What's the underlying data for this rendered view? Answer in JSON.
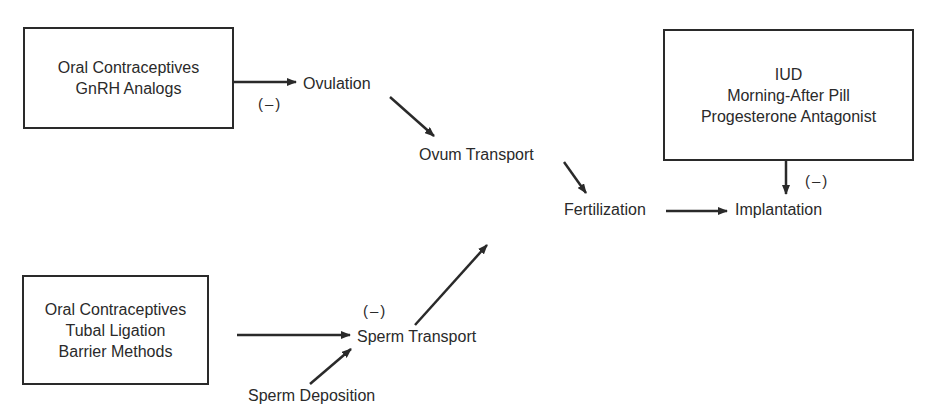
{
  "diagram": {
    "boxes": {
      "ovulation_inhibitors": {
        "lines": [
          "Oral Contraceptives",
          "GnRH Analogs"
        ]
      },
      "implantation_inhibitors": {
        "lines": [
          "IUD",
          "Morning-After Pill",
          "Progesterone Antagonist"
        ]
      },
      "sperm_transport_inhibitors": {
        "lines": [
          "Oral Contraceptives",
          "Tubal Ligation",
          "Barrier Methods"
        ]
      }
    },
    "nodes": {
      "ovulation": "Ovulation",
      "ovum_transport": "Ovum Transport",
      "fertilization": "Fertilization",
      "implantation": "Implantation",
      "sperm_transport": "Sperm Transport",
      "sperm_deposition": "Sperm Deposition"
    },
    "inhibition_marks": {
      "ovulation": "(–)",
      "implantation": "(–)",
      "sperm_transport": "(–)"
    },
    "colors": {
      "line": "#2a2a2a",
      "background": "#ffffff"
    }
  }
}
